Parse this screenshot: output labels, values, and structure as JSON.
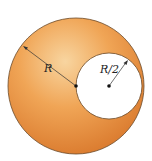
{
  "diagram": {
    "colors": {
      "sphere_light": "#f6c98c",
      "sphere_mid": "#ee9a45",
      "sphere_dark": "#d9772a",
      "outline": "#6b4a2a",
      "cavity": "#ffffff",
      "line": "#333333"
    },
    "outer_sphere": {
      "cx": 76,
      "cy": 86,
      "r": 68
    },
    "cavity": {
      "cx": 109,
      "cy": 86,
      "r": 33
    },
    "labels": {
      "outer_radius": "R",
      "cavity_radius": "R/2"
    }
  }
}
